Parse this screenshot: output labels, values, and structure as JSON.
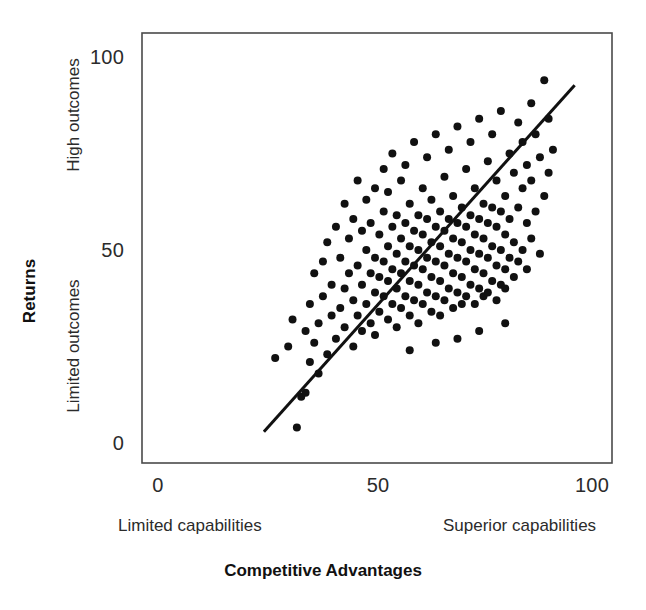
{
  "chart_data": {
    "type": "scatter",
    "title": "",
    "xlabel": "Competitive Advantages",
    "ylabel": "Returns",
    "xlim": [
      0,
      110
    ],
    "ylim": [
      -10,
      110
    ],
    "grid": false,
    "legend": "none",
    "xticks": [
      "0",
      "50",
      "100"
    ],
    "xtick_values": [
      0,
      50,
      100
    ],
    "yticks": [
      "0",
      "50",
      "100"
    ],
    "ytick_values": [
      0,
      50,
      100
    ],
    "x_axis_low_label": "Limited capabilities",
    "x_axis_high_label": "Superior capabilities",
    "y_axis_low_label": "Limited outcomes",
    "y_axis_high_label": "High outcomes",
    "marker": "filled-circle",
    "marker_color": "#111111",
    "marker_size": 8,
    "trendline": {
      "label": "regression-line",
      "color": "#111111",
      "width": 3,
      "x_start": 24.4,
      "y_start": 2.9,
      "x_end": 96.0,
      "y_end": 92.7
    },
    "n_points": 191,
    "points": [
      [
        27,
        22
      ],
      [
        30,
        25
      ],
      [
        31,
        32
      ],
      [
        32,
        4
      ],
      [
        33,
        12
      ],
      [
        34,
        13
      ],
      [
        34,
        29
      ],
      [
        35,
        21
      ],
      [
        35,
        36
      ],
      [
        36,
        26
      ],
      [
        36,
        44
      ],
      [
        37,
        31
      ],
      [
        37,
        18
      ],
      [
        38,
        38
      ],
      [
        38,
        47
      ],
      [
        39,
        23
      ],
      [
        39,
        52
      ],
      [
        40,
        33
      ],
      [
        40,
        41
      ],
      [
        41,
        27
      ],
      [
        41,
        56
      ],
      [
        42,
        35
      ],
      [
        42,
        48
      ],
      [
        43,
        30
      ],
      [
        43,
        40
      ],
      [
        43,
        62
      ],
      [
        44,
        44
      ],
      [
        44,
        53
      ],
      [
        45,
        25
      ],
      [
        45,
        37
      ],
      [
        45,
        58
      ],
      [
        46,
        33
      ],
      [
        46,
        46
      ],
      [
        46,
        68
      ],
      [
        47,
        29
      ],
      [
        47,
        41
      ],
      [
        47,
        55
      ],
      [
        48,
        36
      ],
      [
        48,
        50
      ],
      [
        48,
        63
      ],
      [
        49,
        31
      ],
      [
        49,
        44
      ],
      [
        49,
        57
      ],
      [
        50,
        39
      ],
      [
        50,
        48
      ],
      [
        50,
        66
      ],
      [
        50,
        28
      ],
      [
        51,
        34
      ],
      [
        51,
        43
      ],
      [
        51,
        54
      ],
      [
        52,
        38
      ],
      [
        52,
        47
      ],
      [
        52,
        60
      ],
      [
        52,
        71
      ],
      [
        53,
        32
      ],
      [
        53,
        42
      ],
      [
        53,
        51
      ],
      [
        53,
        65
      ],
      [
        54,
        36
      ],
      [
        54,
        45
      ],
      [
        54,
        56
      ],
      [
        54,
        75
      ],
      [
        55,
        40
      ],
      [
        55,
        49
      ],
      [
        55,
        59
      ],
      [
        55,
        30
      ],
      [
        56,
        35
      ],
      [
        56,
        44
      ],
      [
        56,
        53
      ],
      [
        56,
        68
      ],
      [
        57,
        38
      ],
      [
        57,
        47
      ],
      [
        57,
        57
      ],
      [
        57,
        72
      ],
      [
        58,
        33
      ],
      [
        58,
        42
      ],
      [
        58,
        51
      ],
      [
        58,
        62
      ],
      [
        59,
        37
      ],
      [
        59,
        46
      ],
      [
        59,
        55
      ],
      [
        59,
        78
      ],
      [
        60,
        41
      ],
      [
        60,
        50
      ],
      [
        60,
        59
      ],
      [
        60,
        31
      ],
      [
        61,
        36
      ],
      [
        61,
        45
      ],
      [
        61,
        54
      ],
      [
        61,
        66
      ],
      [
        62,
        39
      ],
      [
        62,
        48
      ],
      [
        62,
        58
      ],
      [
        62,
        74
      ],
      [
        63,
        34
      ],
      [
        63,
        43
      ],
      [
        63,
        52
      ],
      [
        63,
        63
      ],
      [
        64,
        38
      ],
      [
        64,
        47
      ],
      [
        64,
        56
      ],
      [
        64,
        80
      ],
      [
        65,
        42
      ],
      [
        65,
        51
      ],
      [
        65,
        60
      ],
      [
        65,
        33
      ],
      [
        66,
        37
      ],
      [
        66,
        46
      ],
      [
        66,
        55
      ],
      [
        66,
        69
      ],
      [
        67,
        40
      ],
      [
        67,
        49
      ],
      [
        67,
        58
      ],
      [
        67,
        76
      ],
      [
        68,
        35
      ],
      [
        68,
        44
      ],
      [
        68,
        53
      ],
      [
        68,
        64
      ],
      [
        69,
        39
      ],
      [
        69,
        48
      ],
      [
        69,
        57
      ],
      [
        69,
        82
      ],
      [
        70,
        43
      ],
      [
        70,
        52
      ],
      [
        70,
        61
      ],
      [
        70,
        36
      ],
      [
        71,
        38
      ],
      [
        71,
        47
      ],
      [
        71,
        56
      ],
      [
        71,
        71
      ],
      [
        72,
        41
      ],
      [
        72,
        50
      ],
      [
        72,
        59
      ],
      [
        72,
        78
      ],
      [
        73,
        36
      ],
      [
        73,
        45
      ],
      [
        73,
        54
      ],
      [
        73,
        66
      ],
      [
        74,
        40
      ],
      [
        74,
        49
      ],
      [
        74,
        58
      ],
      [
        74,
        84
      ],
      [
        75,
        44
      ],
      [
        75,
        53
      ],
      [
        75,
        62
      ],
      [
        75,
        38
      ],
      [
        76,
        39
      ],
      [
        76,
        48
      ],
      [
        76,
        57
      ],
      [
        76,
        73
      ],
      [
        77,
        42
      ],
      [
        77,
        51
      ],
      [
        77,
        61
      ],
      [
        77,
        80
      ],
      [
        78,
        37
      ],
      [
        78,
        46
      ],
      [
        78,
        56
      ],
      [
        78,
        68
      ],
      [
        79,
        41
      ],
      [
        79,
        50
      ],
      [
        79,
        60
      ],
      [
        79,
        86
      ],
      [
        80,
        45
      ],
      [
        80,
        54
      ],
      [
        80,
        64
      ],
      [
        80,
        40
      ],
      [
        81,
        48
      ],
      [
        81,
        58
      ],
      [
        81,
        75
      ],
      [
        82,
        43
      ],
      [
        82,
        52
      ],
      [
        82,
        70
      ],
      [
        83,
        47
      ],
      [
        83,
        61
      ],
      [
        83,
        83
      ],
      [
        84,
        50
      ],
      [
        84,
        66
      ],
      [
        84,
        78
      ],
      [
        85,
        45
      ],
      [
        85,
        57
      ],
      [
        85,
        72
      ],
      [
        86,
        53
      ],
      [
        86,
        68
      ],
      [
        86,
        88
      ],
      [
        87,
        60
      ],
      [
        87,
        80
      ],
      [
        88,
        49
      ],
      [
        88,
        74
      ],
      [
        89,
        64
      ],
      [
        89,
        94
      ],
      [
        90,
        70
      ],
      [
        90,
        84
      ],
      [
        91,
        76
      ],
      [
        74,
        29
      ],
      [
        69,
        27
      ],
      [
        64,
        26
      ],
      [
        58,
        24
      ],
      [
        80,
        31
      ]
    ]
  },
  "axes": {
    "frame": {
      "left": 142,
      "top": 33,
      "right": 612,
      "bottom": 463
    },
    "frame_color": "#4a4a4a"
  }
}
